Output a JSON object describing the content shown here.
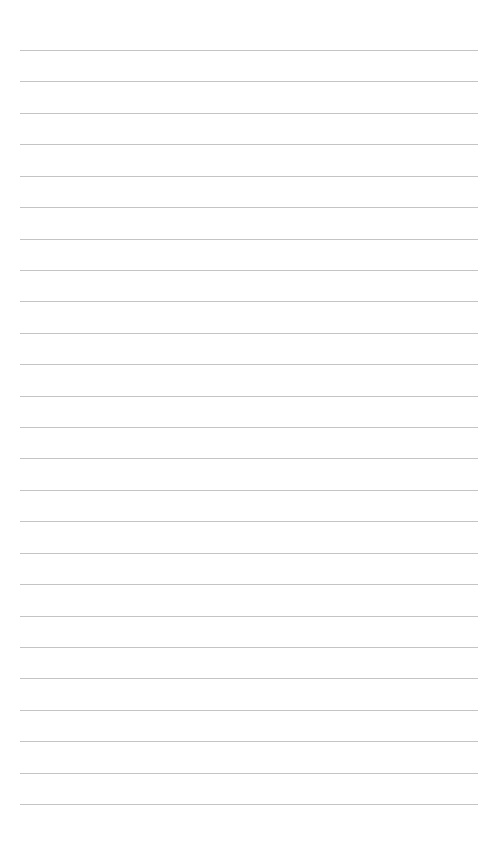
{
  "page": {
    "type": "lined-paper",
    "background_color": "#ffffff",
    "line_color": "#c4c4c4",
    "line_count": 25,
    "first_line_y": 50,
    "line_spacing": 31.42,
    "line_left": 20,
    "line_right": 478,
    "text_content": []
  }
}
